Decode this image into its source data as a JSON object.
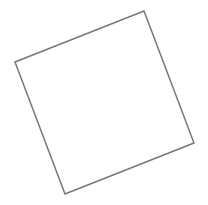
{
  "canvas": {
    "width": 208,
    "height": 205,
    "background": "#ffffff"
  },
  "shape": {
    "type": "rotated-square-outline",
    "stroke_color": "#777777",
    "stroke_width": 1.5,
    "fill": "none",
    "points": {
      "top": [
        144,
        11
      ],
      "right": [
        194,
        143
      ],
      "bottom": [
        65,
        194
      ],
      "left": [
        15,
        62
      ]
    },
    "points_string": "144,11 194,143 65,194 15,62"
  }
}
